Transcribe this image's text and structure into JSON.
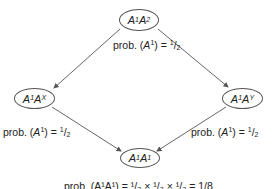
{
  "nodes": {
    "top": {
      "base": "A",
      "sup1": "1",
      "base2": "A",
      "sup2": "2"
    },
    "left": {
      "base": "A",
      "sup1": "1",
      "base2": "A",
      "sup2": "X"
    },
    "right": {
      "base": "A",
      "sup1": "1",
      "base2": "A",
      "sup2": "Y"
    },
    "bottom": {
      "base": "A",
      "sup1": "1",
      "base2": "A",
      "sup2": "1"
    }
  },
  "labels": {
    "top": {
      "prefix": "prob. (",
      "var": "A",
      "sup": "1",
      "mid": ") = ",
      "num": "1",
      "slash": "/",
      "den": "2"
    },
    "left": {
      "prefix": "prob. (",
      "var": "A",
      "sup": "1",
      "mid": ") = ",
      "num": "1",
      "slash": "/",
      "den": "2"
    },
    "right": {
      "prefix": "prob. (",
      "var": "A",
      "sup": "1",
      "mid": ") = ",
      "num": "1",
      "slash": "/",
      "den": "2"
    },
    "bottom": {
      "text": "prob. (A¹A¹) = ¹/₂ × ¹/₂ × ¹/₂ = 1/8"
    }
  },
  "colors": {
    "line": "#555555",
    "text": "#222222"
  }
}
